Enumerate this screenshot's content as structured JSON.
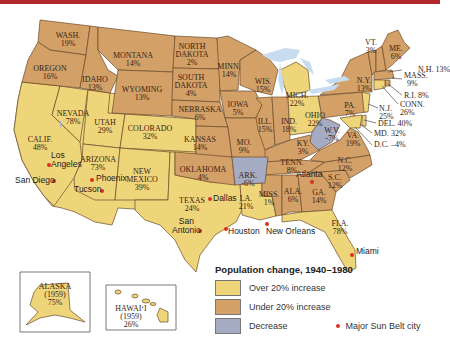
{
  "colors": {
    "over20": "#efd57a",
    "under20": "#d3a068",
    "decrease": "#a6abc4",
    "water": "#c7dcef",
    "border": "#6b4a2a",
    "city_dot": "#d8321e",
    "top_bar": "#b0282a"
  },
  "legend": {
    "title": "Population change, 1940–1980",
    "items": [
      {
        "label": "Over 20% increase",
        "color": "#efd57a"
      },
      {
        "label": "Under 20% increase",
        "color": "#d3a068"
      },
      {
        "label": "Decrease",
        "color": "#a6abc4"
      }
    ],
    "city_marker_label": "Major Sun Belt city"
  },
  "states": [
    {
      "name": "WASH.",
      "value": "19%",
      "category": "under20"
    },
    {
      "name": "OREGON",
      "value": "16%",
      "category": "under20"
    },
    {
      "name": "CALIF.",
      "value": "48%",
      "category": "over20"
    },
    {
      "name": "IDAHO",
      "value": "13%",
      "category": "under20"
    },
    {
      "name": "NEVADA",
      "value": "78%",
      "category": "over20"
    },
    {
      "name": "MONTANA",
      "value": "14%",
      "category": "under20"
    },
    {
      "name": "WYOMING",
      "value": "13%",
      "category": "under20"
    },
    {
      "name": "UTAH",
      "value": "29%",
      "category": "over20"
    },
    {
      "name": "ARIZONA",
      "value": "73%",
      "category": "over20"
    },
    {
      "name": "COLORADO",
      "value": "32%",
      "category": "over20"
    },
    {
      "name": "NEW MEXICO",
      "value": "39%",
      "category": "over20"
    },
    {
      "name": "NORTH DAKOTA",
      "value": "2%",
      "category": "under20"
    },
    {
      "name": "SOUTH DAKOTA",
      "value": "4%",
      "category": "under20"
    },
    {
      "name": "NEBRASKA",
      "value": "6%",
      "category": "under20"
    },
    {
      "name": "KANSAS",
      "value": "14%",
      "category": "under20"
    },
    {
      "name": "OKLAHOMA",
      "value": "4%",
      "category": "under20"
    },
    {
      "name": "TEXAS",
      "value": "24%",
      "category": "over20"
    },
    {
      "name": "MINN.",
      "value": "14%",
      "category": "under20"
    },
    {
      "name": "IOWA",
      "value": "5%",
      "category": "under20"
    },
    {
      "name": "MO.",
      "value": "9%",
      "category": "under20"
    },
    {
      "name": "ARK.",
      "value": "-6%",
      "category": "decrease"
    },
    {
      "name": "LA.",
      "value": "21%",
      "category": "over20"
    },
    {
      "name": "WIS.",
      "value": "15%",
      "category": "under20"
    },
    {
      "name": "ILL.",
      "value": "15%",
      "category": "under20"
    },
    {
      "name": "MISS.",
      "value": "1%",
      "category": "under20"
    },
    {
      "name": "MICH.",
      "value": "22%",
      "category": "over20"
    },
    {
      "name": "IND.",
      "value": "18%",
      "category": "under20"
    },
    {
      "name": "KY.",
      "value": "3%",
      "category": "under20"
    },
    {
      "name": "TENN.",
      "value": "8%",
      "category": "under20"
    },
    {
      "name": "ALA.",
      "value": "6%",
      "category": "under20"
    },
    {
      "name": "OHIO",
      "value": "22%",
      "category": "over20"
    },
    {
      "name": "W.V.",
      "value": "-7%",
      "category": "decrease"
    },
    {
      "name": "GA.",
      "value": "14%",
      "category": "under20"
    },
    {
      "name": "FLA.",
      "value": "78%",
      "category": "over20"
    },
    {
      "name": "S.C.",
      "value": "12%",
      "category": "under20"
    },
    {
      "name": "N.C.",
      "value": "12%",
      "category": "under20"
    },
    {
      "name": "VA.",
      "value": "19%",
      "category": "under20"
    },
    {
      "name": "PA.",
      "value": "7%",
      "category": "under20"
    },
    {
      "name": "N.Y.",
      "value": "13%",
      "category": "under20"
    },
    {
      "name": "VT.",
      "value": "3%",
      "category": "under20"
    },
    {
      "name": "ME.",
      "value": "6%",
      "category": "under20"
    },
    {
      "name": "N.H.",
      "value": "13%",
      "category": "under20"
    },
    {
      "name": "MASS.",
      "value": "9%",
      "category": "under20"
    },
    {
      "name": "R.I.",
      "value": "8%",
      "category": "under20"
    },
    {
      "name": "CONN.",
      "value": "26%",
      "category": "over20"
    },
    {
      "name": "N.J.",
      "value": "25%",
      "category": "over20"
    },
    {
      "name": "DEL.",
      "value": "40%",
      "category": "over20"
    },
    {
      "name": "MD.",
      "value": "32%",
      "category": "over20"
    },
    {
      "name": "D.C.",
      "value": "-4%",
      "category": "decrease"
    },
    {
      "name": "ALASKA",
      "year": "(1959)",
      "value": "75%",
      "category": "over20"
    },
    {
      "name": "HAWAIʻI",
      "year": "(1959)",
      "value": "26%",
      "category": "over20"
    }
  ],
  "labels": {
    "wash": {
      "name": "WASH.",
      "value": "19%"
    },
    "oregon": {
      "name": "OREGON",
      "value": "16%"
    },
    "calif": {
      "name": "CALIF.",
      "value": "48%"
    },
    "idaho": {
      "name": "IDAHO",
      "value": "13%"
    },
    "nevada": {
      "name": "NEVADA",
      "value": "78%"
    },
    "montana": {
      "name": "MONTANA",
      "value": "14%"
    },
    "wyoming": {
      "name": "WYOMING",
      "value": "13%"
    },
    "utah": {
      "name": "UTAH",
      "value": "29%"
    },
    "arizona": {
      "name": "ARIZONA",
      "value": "73%"
    },
    "colorado": {
      "name": "COLORADO",
      "value": "32%"
    },
    "newmexico": {
      "name1": "NEW",
      "name2": "MEXICO",
      "value": "39%"
    },
    "ndakota": {
      "name1": "NORTH",
      "name2": "DAKOTA",
      "value": "2%"
    },
    "sdakota": {
      "name1": "SOUTH",
      "name2": "DAKOTA",
      "value": "4%"
    },
    "nebraska": {
      "name": "NEBRASKA",
      "value": "6%"
    },
    "kansas": {
      "name": "KANSAS",
      "value": "14%"
    },
    "oklahoma": {
      "name": "OKLAHOMA",
      "value": "4%"
    },
    "texas": {
      "name": "TEXAS",
      "value": "24%"
    },
    "minn": {
      "name": "MINN.",
      "value": "14%"
    },
    "iowa": {
      "name": "IOWA",
      "value": "5%"
    },
    "mo": {
      "name": "MO.",
      "value": "9%"
    },
    "ark": {
      "name": "ARK.",
      "value": "-6%"
    },
    "la": {
      "name": "LA.",
      "value": "21%"
    },
    "wis": {
      "name": "WIS.",
      "value": "15%"
    },
    "ill": {
      "name": "ILL.",
      "value": "15%"
    },
    "miss": {
      "name": "MISS.",
      "value": "1%"
    },
    "mich": {
      "name": "MICH.",
      "value": "22%"
    },
    "ind": {
      "name": "IND.",
      "value": "18%"
    },
    "ky": {
      "name": "KY.",
      "value": "3%"
    },
    "tenn": {
      "name": "TENN.",
      "value": "8%"
    },
    "ala": {
      "name": "ALA.",
      "value": "6%"
    },
    "ohio": {
      "name": "OHIO",
      "value": "22%"
    },
    "wv": {
      "name": "W.V.",
      "value": "-7%"
    },
    "ga": {
      "name": "GA.",
      "value": "14%"
    },
    "fla": {
      "name": "FLA.",
      "value": "78%"
    },
    "sc": {
      "name": "S.C.",
      "value": "12%"
    },
    "nc": {
      "name": "N.C.",
      "value": "12%"
    },
    "va": {
      "name": "VA.",
      "value": "19%"
    },
    "pa": {
      "name": "PA.",
      "value": "7%"
    },
    "ny": {
      "name": "N.Y.",
      "value": "13%"
    },
    "vt": {
      "name": "VT.",
      "value": "3%"
    },
    "me": {
      "name": "ME.",
      "value": "6%"
    },
    "nh": "N.H. 13%",
    "mass1": "MASS.",
    "mass2": "9%",
    "ri": "R.I. 8%",
    "conn1": "CONN.",
    "conn2": "26%",
    "nj1": "N.J.",
    "nj2": "25%",
    "del": "DEL. 40%",
    "md": "MD. 32%",
    "dc": "D.C. –4%",
    "alaska": {
      "name": "ALASKA",
      "year": "(1959)",
      "value": "75%"
    },
    "hawaii": {
      "name": "HAWAIʻI",
      "year": "(1959)",
      "value": "26%"
    }
  },
  "cities": [
    {
      "name": "San Diego"
    },
    {
      "name": "Los Angeles",
      "line1": "Los",
      "line2": "Angeles"
    },
    {
      "name": "Phoenix"
    },
    {
      "name": "Tucson"
    },
    {
      "name": "Dallas"
    },
    {
      "name": "San Antonio",
      "line1": "San",
      "line2": "Antonio"
    },
    {
      "name": "Houston"
    },
    {
      "name": "New Orleans"
    },
    {
      "name": "Atlanta"
    },
    {
      "name": "Miami"
    }
  ]
}
